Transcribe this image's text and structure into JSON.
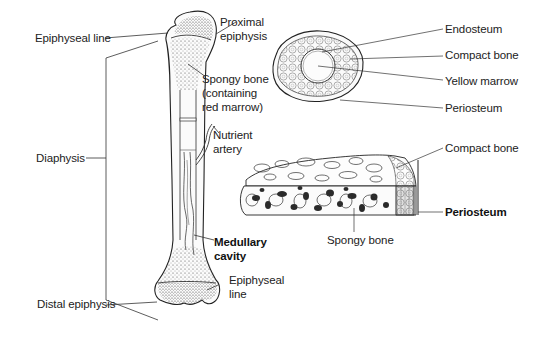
{
  "figure": {
    "long_bone": {
      "labels": {
        "epiphyseal_line_top": "Epiphyseal line",
        "proximal_epiphysis": [
          "Proximal",
          "epiphysis"
        ],
        "spongy_bone": [
          "Spongy bone",
          "(containing",
          "red marrow)"
        ],
        "nutrient_artery": [
          "Nutrient",
          "artery"
        ],
        "diaphysis": "Diaphysis",
        "medullary_cavity": [
          "Medullary",
          "cavity"
        ],
        "epiphyseal_line_bottom": [
          "Epiphyseal",
          "line"
        ],
        "distal_epiphysis": "Distal epiphysis"
      }
    },
    "cross_section": {
      "labels": {
        "endosteum": "Endosteum",
        "compact_bone": "Compact bone",
        "yellow_marrow": "Yellow marrow",
        "periosteum": "Periosteum"
      }
    },
    "bone_block": {
      "labels": {
        "compact_bone": "Compact bone",
        "periosteum": "Periosteum",
        "spongy_bone": "Spongy bone"
      }
    }
  }
}
